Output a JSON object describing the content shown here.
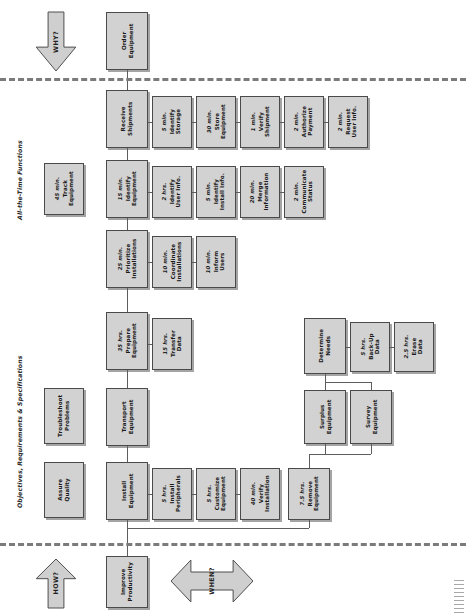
{
  "diagram": {
    "captions": {
      "all_time": "All-the-Time Functions",
      "objectives": "Objectives, Requirements & Specifications"
    },
    "arrows": {
      "why": "WHY?",
      "how": "HOW?",
      "when": "WHEN?"
    },
    "nodes": [
      {
        "id": "order_equipment",
        "time": "",
        "name": "Order\nEquipment"
      },
      {
        "id": "receive_shipments",
        "time": "",
        "name": "Receive\nShipments"
      },
      {
        "id": "identify_storage",
        "time": "5 min.",
        "name": "Identify\nStorage"
      },
      {
        "id": "store_equipment",
        "time": "30 min.",
        "name": "Store\nEquipment"
      },
      {
        "id": "verify_shipment",
        "time": "1 min.",
        "name": "Verify\nShipment"
      },
      {
        "id": "authorize_payment",
        "time": "2 min.",
        "name": "Authorize\nPayment"
      },
      {
        "id": "request_user_info",
        "time": "2 min.",
        "name": "Request\nUser Info."
      },
      {
        "id": "track_equipment",
        "time": "45 min.",
        "name": "Track\nEquipment"
      },
      {
        "id": "identify_equipment",
        "time": "15 min.",
        "name": "Identify\nEquipment"
      },
      {
        "id": "identify_user_info",
        "time": "2 hrs.",
        "name": "Identify\nUser Info."
      },
      {
        "id": "identify_install_info",
        "time": "5 min.",
        "name": "Identify\nInstall Info."
      },
      {
        "id": "merge_information",
        "time": "20 min.",
        "name": "Merge\nInformation"
      },
      {
        "id": "communicate_status",
        "time": "2 min.",
        "name": "Communicate\nStatus"
      },
      {
        "id": "prioritize_installations",
        "time": "25 min.",
        "name": "Prioritize\nInstallations"
      },
      {
        "id": "coordinate_installations",
        "time": "10 min.",
        "name": "Coordinate\nInstallations"
      },
      {
        "id": "inform_users",
        "time": "10 min.",
        "name": "Inform\nUsers"
      },
      {
        "id": "prepare_equipment",
        "time": "35 hrs.",
        "name": "Prepare\nEquipment"
      },
      {
        "id": "transfer_data",
        "time": "15 hrs.",
        "name": "Transfer\nData"
      },
      {
        "id": "determine_needs",
        "time": "",
        "name": "Determine\nNeeds"
      },
      {
        "id": "backup_data",
        "time": "5 hrs.",
        "name": "Back-Up\nData"
      },
      {
        "id": "erase_data",
        "time": "2.5 hrs.",
        "name": "Erase\nData"
      },
      {
        "id": "troubleshoot_problems",
        "time": "",
        "name": "Troubleshoot\nProblems"
      },
      {
        "id": "transport_equipment",
        "time": "",
        "name": "Transport\nEquipment"
      },
      {
        "id": "surplus_equipment",
        "time": "",
        "name": "Surplus\nEquipment"
      },
      {
        "id": "survey_equipment",
        "time": "",
        "name": "Survey\nEquipment"
      },
      {
        "id": "assure_quality",
        "time": "",
        "name": "Assure\nQuality"
      },
      {
        "id": "install_equipment",
        "time": "",
        "name": "Install\nEquipment"
      },
      {
        "id": "install_peripherals",
        "time": "5 hrs.",
        "name": "Install\nPeripherals"
      },
      {
        "id": "customize_equipment",
        "time": "5 hrs.",
        "name": "Customize\nEquipment"
      },
      {
        "id": "verify_installation",
        "time": "40 min.",
        "name": "Verify\nInstallation"
      },
      {
        "id": "remove_equipment",
        "time": "7.5 hrs.",
        "name": "Remove\nEquipment"
      },
      {
        "id": "improve_productivity",
        "time": "",
        "name": "Improve\nProductivity"
      }
    ],
    "colors": {
      "box_fill": "#d2d2d2",
      "box_border": "#4a4a4a",
      "line": "#5d5d5d",
      "dash": "#7b7b7b",
      "arrow_fill": "#cfcfcf"
    }
  }
}
